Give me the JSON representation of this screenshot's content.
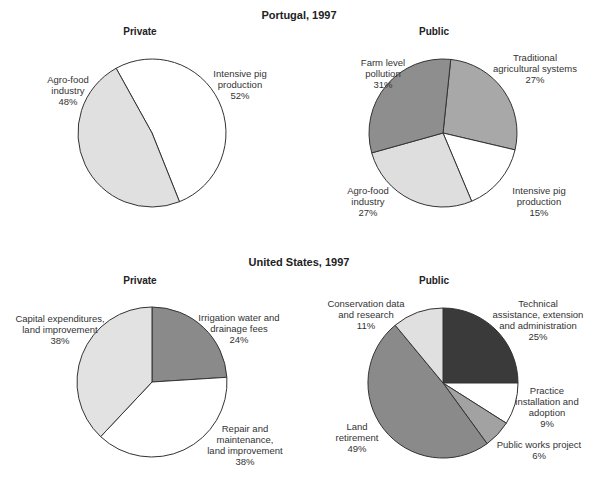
{
  "figure": {
    "sections": [
      {
        "title": "Portugal, 1997"
      },
      {
        "title": "United States, 1997"
      }
    ]
  },
  "chart_data": [
    {
      "type": "pie",
      "title": "Portugal, 1997 — Private",
      "subtitle": "Private",
      "center": [
        152,
        133
      ],
      "radius": 74,
      "start_angle": -29,
      "slices": [
        {
          "label": "Intensive pig\nproduction",
          "value": 52,
          "color": "#ffffff"
        },
        {
          "label": "Agro-food\nindustry",
          "value": 48,
          "color": "#e0e0e0"
        }
      ]
    },
    {
      "type": "pie",
      "title": "Portugal, 1997 — Public",
      "subtitle": "Public",
      "center": [
        443,
        133
      ],
      "radius": 74,
      "start_angle": 6,
      "slices": [
        {
          "label": "Traditional\nagricultural systems",
          "value": 27,
          "color": "#a8a8a8"
        },
        {
          "label": "Intensive pig\nproduction",
          "value": 15,
          "color": "#ffffff"
        },
        {
          "label": "Agro-food\nindustry",
          "value": 27,
          "color": "#dedede"
        },
        {
          "label": "Farm level\npollution",
          "value": 31,
          "color": "#8e8e8e"
        }
      ]
    },
    {
      "type": "pie",
      "title": "United States, 1997 — Private",
      "subtitle": "Private",
      "center": [
        152,
        382
      ],
      "radius": 75,
      "start_angle": 0,
      "slices": [
        {
          "label": "Irrigation water and\ndrainage fees",
          "value": 24,
          "color": "#8a8a8a"
        },
        {
          "label": "Repair and\nmaintenance,\nland improvement",
          "value": 38,
          "color": "#ffffff"
        },
        {
          "label": "Capital expenditures,\nland improvement",
          "value": 38,
          "color": "#e2e2e2"
        }
      ]
    },
    {
      "type": "pie",
      "title": "United States, 1997 — Public",
      "subtitle": "Public",
      "center": [
        443,
        383
      ],
      "radius": 75,
      "start_angle": 0,
      "slices": [
        {
          "label": "Technical\nassistance, extension\nand administration",
          "value": 25,
          "color": "#3a3a3a"
        },
        {
          "label": "Practice\ninstallation and\nadoption",
          "value": 9,
          "color": "#ffffff"
        },
        {
          "label": "Public works project",
          "value": 6,
          "color": "#a2a2a2"
        },
        {
          "label": "Land\nretirement",
          "value": 49,
          "color": "#8a8a8a"
        },
        {
          "label": "Conservation data\nand research",
          "value": 11,
          "color": "#e0e0e0"
        }
      ]
    }
  ],
  "labels": {
    "pt_private": {
      "subtitle": "Private",
      "s0": "Intensive pig\nproduction\n52%",
      "s1": "Agro-food\nindustry\n48%"
    },
    "pt_public": {
      "subtitle": "Public",
      "s0": "Traditional\nagricultural systems\n27%",
      "s1": "Intensive pig\nproduction\n15%",
      "s2": "Agro-food\nindustry\n27%",
      "s3": "Farm level\npollution\n31%"
    },
    "us_private": {
      "subtitle": "Private",
      "s0": "Irrigation water and\ndrainage fees\n24%",
      "s1": "Repair and\nmaintenance,\nland improvement\n38%",
      "s2": "Capital expenditures,\nland improvement\n38%"
    },
    "us_public": {
      "subtitle": "Public",
      "s0": "Technical\nassistance, extension\nand administration\n25%",
      "s1": "Practice\ninstallation and\nadoption\n9%",
      "s2": "Public works project\n6%",
      "s3": "Land\nretirement\n49%",
      "s4": "Conservation data\nand research\n11%"
    }
  }
}
